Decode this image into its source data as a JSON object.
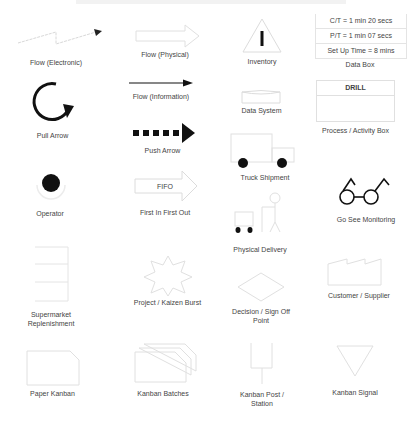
{
  "symbols": {
    "flow_electronic": {
      "label": "Flow (Electronic)",
      "icon": "lightning-arrow-icon"
    },
    "flow_physical": {
      "label": "Flow (Physical)",
      "icon": "hollow-arrow-icon"
    },
    "inventory": {
      "label": "Inventory",
      "icon": "triangle-i-icon"
    },
    "data_box": {
      "label": "Data Box",
      "rows": [
        "C/T = 1 min 20 secs",
        "P/T = 1 min 07 secs",
        "Set Up Time = 8 mins"
      ]
    },
    "pull_arrow": {
      "label": "Pull Arrow",
      "icon": "circular-arrow-icon"
    },
    "flow_information": {
      "label": "Flow (Information)",
      "icon": "line-arrow-icon"
    },
    "data_system": {
      "label": "Data System",
      "icon": "cylinder-icon"
    },
    "process_box": {
      "label": "Process / Activity Box",
      "header": "DRILL"
    },
    "push_arrow": {
      "label": "Push Arrow",
      "icon": "dashed-bold-arrow-icon"
    },
    "truck_shipment": {
      "label": "Truck Shipment",
      "icon": "truck-icon"
    },
    "operator": {
      "label": "Operator",
      "icon": "operator-icon"
    },
    "fifo": {
      "label": "First In First Out",
      "arrow_text": "FIFO"
    },
    "physical_delivery": {
      "label": "Physical Delivery",
      "icon": "cart-person-icon"
    },
    "go_see": {
      "label": "Go See Monitoring",
      "icon": "glasses-icon"
    },
    "supermarket": {
      "label": "Supermarket Replenishment",
      "icon": "supermarket-icon"
    },
    "kaizen": {
      "label": "Project / Kaizen Burst",
      "icon": "burst-icon"
    },
    "decision": {
      "label": "Decision / Sign Off Point",
      "icon": "diamond-icon"
    },
    "customer": {
      "label": "Customer / Supplier",
      "icon": "factory-icon"
    },
    "paper_kanban": {
      "label": "Paper Kanban",
      "icon": "kanban-card-icon"
    },
    "kanban_batches": {
      "label": "Kanban Batches",
      "icon": "stacked-kanban-icon"
    },
    "kanban_post": {
      "label": "Kanban Post / Station",
      "icon": "post-icon"
    },
    "kanban_signal": {
      "label": "Kanban Signal",
      "icon": "inverted-triangle-icon"
    }
  },
  "colors": {
    "faint_line": "#e2e2e2",
    "dark": "#111111",
    "text": "#444444"
  }
}
